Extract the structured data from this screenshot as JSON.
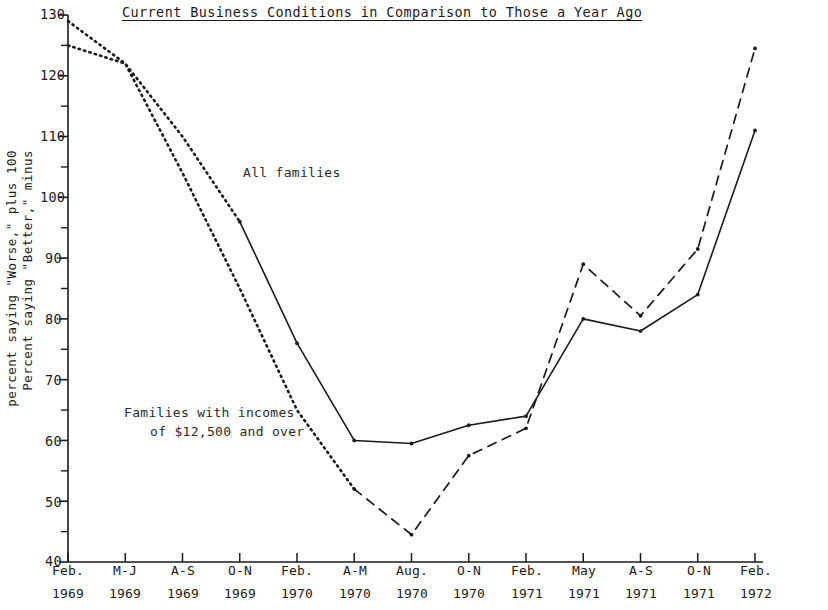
{
  "chart_data": {
    "type": "line",
    "title": "Current Business Conditions in Comparison to Those a Year Ago",
    "xlabel": "",
    "ylabel": "Percent saying \"Better,\" minus percent saying \"Worse,\" plus 100",
    "ylabel_line1": "Percent saying \"Better,\" minus",
    "ylabel_line2": "percent saying \"Worse,\" plus 100",
    "ylim": [
      40,
      130
    ],
    "ytick_major": [
      40,
      50,
      60,
      70,
      80,
      90,
      100,
      110,
      120,
      130
    ],
    "ytick_minor": [
      45,
      55,
      65,
      75,
      85,
      95,
      105,
      115,
      125
    ],
    "grid": false,
    "legend_position": "inline-annotation",
    "categories": [
      "Feb. 1969",
      "M-J 1969",
      "A-S 1969",
      "O-N 1969",
      "Feb. 1970",
      "A-M 1970",
      "Aug. 1970",
      "O-N 1970",
      "Feb. 1971",
      "May 1971",
      "A-S 1971",
      "O-N 1971",
      "Feb. 1972"
    ],
    "categories_top": [
      "Feb.",
      "M-J",
      "A-S",
      "O-N",
      "Feb.",
      "A-M",
      "Aug.",
      "O-N",
      "Feb.",
      "May",
      "A-S",
      "O-N",
      "Feb."
    ],
    "categories_bottom": [
      "1969",
      "1969",
      "1969",
      "1969",
      "1970",
      "1970",
      "1970",
      "1970",
      "1971",
      "1971",
      "1971",
      "1971",
      "1972"
    ],
    "series": [
      {
        "name": "All families",
        "style": "solid",
        "lead_style": "dotted",
        "lead_points": 3,
        "values": [
          129,
          122,
          110,
          96,
          76,
          60,
          59.5,
          62.5,
          64,
          80,
          78,
          84,
          111
        ]
      },
      {
        "name": "Families with incomes of $12,500 and over",
        "style": "dashed",
        "lead_style": "dotted",
        "lead_points": 5,
        "values": [
          125,
          122,
          104,
          85,
          65,
          52,
          44.5,
          57.5,
          62,
          89,
          80.5,
          91.5,
          124.5
        ]
      }
    ],
    "annotations": [
      {
        "text": "All families",
        "x_cat": "O-N 1969",
        "y": 104
      },
      {
        "text": "Families with incomes",
        "x_cat": "A-S 1969",
        "y": 64
      },
      {
        "text": "of $12,500 and over",
        "x_cat": "A-S 1969",
        "y": 60
      }
    ]
  },
  "axis": {
    "y_tick_labels": [
      "130",
      "120",
      "110",
      "100",
      "90",
      "80",
      "70",
      "60",
      "50",
      "40"
    ],
    "x_tick_top": [
      "Feb.",
      "M-J",
      "A-S",
      "O-N",
      "Feb.",
      "A-M",
      "Aug.",
      "O-N",
      "Feb.",
      "May",
      "A-S",
      "O-N",
      "Feb."
    ],
    "x_tick_bottom": [
      "1969",
      "1969",
      "1969",
      "1969",
      "1970",
      "1970",
      "1970",
      "1970",
      "1971",
      "1971",
      "1971",
      "1971",
      "1972"
    ]
  },
  "annotations": {
    "all_families": "All families",
    "high_income_line1": "Families with incomes",
    "high_income_line2": "of $12,500 and over"
  },
  "colors": {
    "axis": "#1a1a1a",
    "series_all_families": "#1a1a1a",
    "series_high_income": "#1a1a1a",
    "background": "#ffffff"
  }
}
